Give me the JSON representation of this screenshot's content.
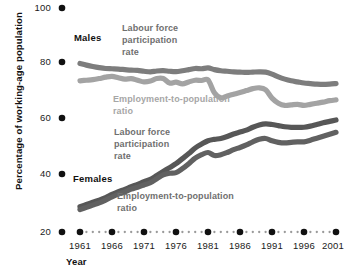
{
  "chart_data": {
    "type": "line",
    "title": "",
    "xlabel": "Year",
    "ylabel": "Percentage of working-age population",
    "xlim": [
      1959,
      2002
    ],
    "ylim": [
      20,
      100
    ],
    "yticks": [
      20,
      40,
      60,
      80,
      100
    ],
    "xticks": [
      1961,
      1966,
      1971,
      1976,
      1981,
      1986,
      1991,
      1996,
      2001
    ],
    "grid": false,
    "legend_position": "inline-annotations",
    "x": [
      1961,
      1962,
      1963,
      1964,
      1965,
      1966,
      1967,
      1968,
      1969,
      1970,
      1971,
      1972,
      1973,
      1974,
      1975,
      1976,
      1977,
      1978,
      1979,
      1980,
      1981,
      1982,
      1983,
      1984,
      1985,
      1986,
      1987,
      1988,
      1989,
      1990,
      1991,
      1992,
      1993,
      1994,
      1995,
      1996,
      1997,
      1998,
      1999,
      2000,
      2001
    ],
    "series": [
      {
        "name": "Males - Labour force participation rate",
        "group": "Males",
        "color": "#7d7d7d",
        "values": [
          80.2,
          79.6,
          79.1,
          78.7,
          78.4,
          78.3,
          78.2,
          78.0,
          77.8,
          77.7,
          77.4,
          77.2,
          77.5,
          77.6,
          77.4,
          77.3,
          77.6,
          78.0,
          78.4,
          78.3,
          78.6,
          78.0,
          77.6,
          77.4,
          77.2,
          77.1,
          77.0,
          77.1,
          77.2,
          77.1,
          76.4,
          75.4,
          74.6,
          74.0,
          73.6,
          73.2,
          73.0,
          72.8,
          72.7,
          72.8,
          73.0
        ]
      },
      {
        "name": "Males - Employment-to-population ratio",
        "group": "Males",
        "color": "#a3a3a3",
        "values": [
          74.0,
          74.2,
          74.4,
          74.8,
          75.3,
          75.6,
          75.1,
          74.6,
          74.8,
          74.2,
          73.6,
          73.9,
          74.8,
          74.8,
          73.2,
          73.5,
          72.9,
          73.6,
          74.2,
          74.1,
          74.3,
          69.7,
          67.9,
          68.6,
          69.2,
          69.8,
          70.5,
          71.2,
          71.5,
          70.8,
          67.8,
          66.0,
          65.2,
          65.4,
          65.6,
          65.2,
          65.6,
          66.0,
          66.4,
          66.9,
          67.2
        ]
      },
      {
        "name": "Females - Labour force participation rate",
        "group": "Females",
        "color": "#575757",
        "values": [
          29.0,
          29.8,
          30.6,
          31.4,
          32.3,
          33.4,
          34.4,
          35.2,
          36.2,
          37.0,
          38.0,
          38.8,
          40.2,
          41.6,
          43.0,
          44.4,
          46.2,
          48.0,
          50.0,
          51.4,
          52.6,
          53.1,
          53.4,
          54.1,
          55.0,
          55.7,
          56.4,
          57.4,
          58.2,
          58.6,
          58.4,
          58.0,
          57.6,
          57.4,
          57.4,
          57.4,
          57.8,
          58.4,
          59.0,
          59.5,
          60.0
        ]
      },
      {
        "name": "Females - Employment-to-population ratio",
        "group": "Females",
        "color": "#616161",
        "values": [
          28.0,
          28.8,
          29.6,
          30.4,
          31.4,
          32.5,
          33.5,
          34.3,
          35.3,
          36.0,
          36.8,
          37.6,
          39.0,
          40.4,
          41.0,
          41.2,
          42.6,
          44.4,
          46.4,
          47.6,
          48.4,
          47.3,
          47.6,
          48.4,
          49.4,
          50.2,
          51.1,
          52.2,
          53.1,
          53.4,
          52.6,
          52.0,
          51.8,
          52.0,
          52.2,
          52.2,
          52.8,
          53.5,
          54.2,
          54.9,
          55.6
        ]
      }
    ],
    "annotations": [
      {
        "id": "males-group",
        "text": "Males",
        "x": 74,
        "y": 41,
        "style": "group"
      },
      {
        "id": "females-group",
        "text": "Females",
        "x": 73,
        "y": 182,
        "style": "group"
      },
      {
        "id": "males-lfp-l1",
        "text": "Labour force",
        "x": 122,
        "y": 31,
        "style": "dark"
      },
      {
        "id": "males-lfp-l2",
        "text": "participation",
        "x": 122,
        "y": 43,
        "style": "dark"
      },
      {
        "id": "males-lfp-l3",
        "text": "rate",
        "x": 122,
        "y": 55,
        "style": "dark"
      },
      {
        "id": "males-epr-l1",
        "text": "Employment-to-population",
        "x": 113,
        "y": 102,
        "style": "light"
      },
      {
        "id": "males-epr-l2",
        "text": "ratio",
        "x": 113,
        "y": 114,
        "style": "light"
      },
      {
        "id": "females-lfp-l1",
        "text": "Labour force",
        "x": 114,
        "y": 135,
        "style": "femdark"
      },
      {
        "id": "females-lfp-l2",
        "text": "participation",
        "x": 114,
        "y": 147,
        "style": "femdark"
      },
      {
        "id": "females-lfp-l3",
        "text": "rate",
        "x": 114,
        "y": 159,
        "style": "femdark"
      },
      {
        "id": "females-epr-l1",
        "text": "Employment-to-population",
        "x": 117,
        "y": 199,
        "style": "femdark"
      },
      {
        "id": "females-epr-l2",
        "text": "ratio",
        "x": 117,
        "y": 211,
        "style": "femdark"
      }
    ]
  },
  "axes": {
    "y_tick_labels": [
      "100",
      "80",
      "60",
      "40",
      "20"
    ],
    "x_tick_labels": [
      "1961",
      "1966",
      "1971",
      "1976",
      "1981",
      "1986",
      "1991",
      "1996",
      "2001"
    ],
    "y_axis_title": "Percentage of working-age population",
    "x_axis_title": "Year"
  },
  "colors": {
    "male_lfp": "#7d7d7d",
    "male_epr": "#a3a3a3",
    "female_lfp": "#575757",
    "female_epr": "#616161",
    "axis_dot": "#111111",
    "background": "#ffffff"
  }
}
